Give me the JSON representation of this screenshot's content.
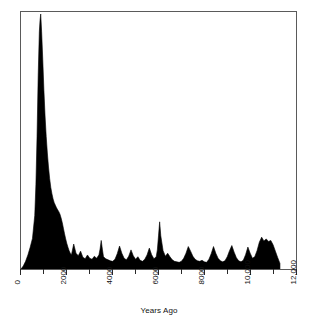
{
  "chart_data": {
    "type": "area",
    "title": "",
    "xlabel": "Years Ago",
    "ylabel": "Probability of Occurrence",
    "xlim": [
      0,
      12000
    ],
    "ylim": [
      0,
      1
    ],
    "grid": false,
    "legend": null,
    "fill_color": "#000000",
    "line_color": "#000000",
    "frame_color": "#5a5a5a",
    "axis_ticks_every": 1000,
    "axis_labels_every": 2000,
    "xtick_values": [
      0,
      1000,
      2000,
      3000,
      4000,
      5000,
      6000,
      7000,
      8000,
      9000,
      10000,
      11000,
      12000
    ],
    "xtick_labels": [
      "0",
      "",
      "2000",
      "",
      "4000",
      "",
      "6000",
      "",
      "8000",
      "",
      "10,000",
      "",
      "12,000"
    ],
    "xtick_labels_rotation_deg": -90,
    "ytick_labels": [],
    "x": [
      0,
      100,
      200,
      300,
      400,
      500,
      600,
      650,
      700,
      750,
      800,
      830,
      860,
      900,
      950,
      1000,
      1050,
      1100,
      1150,
      1200,
      1250,
      1300,
      1350,
      1400,
      1450,
      1500,
      1550,
      1600,
      1650,
      1700,
      1750,
      1800,
      1850,
      1900,
      1950,
      2000,
      2050,
      2100,
      2150,
      2200,
      2300,
      2400,
      2500,
      2600,
      2700,
      2800,
      2900,
      3000,
      3100,
      3200,
      3300,
      3400,
      3450,
      3500,
      3550,
      3600,
      3700,
      3800,
      3900,
      4000,
      4100,
      4200,
      4300,
      4400,
      4500,
      4600,
      4700,
      4800,
      4900,
      5000,
      5100,
      5200,
      5300,
      5400,
      5500,
      5600,
      5700,
      5800,
      5900,
      5950,
      6000,
      6050,
      6100,
      6200,
      6300,
      6400,
      6500,
      6600,
      6700,
      6800,
      6900,
      7000,
      7100,
      7200,
      7300,
      7400,
      7500,
      7600,
      7700,
      7800,
      7900,
      8000,
      8100,
      8200,
      8300,
      8400,
      8500,
      8600,
      8700,
      8800,
      8900,
      9000,
      9100,
      9200,
      9300,
      9400,
      9500,
      9600,
      9700,
      9800,
      9900,
      10000,
      10100,
      10200,
      10300,
      10400,
      10500,
      10600,
      10700,
      10800,
      10900,
      11000,
      11100,
      11200,
      11300
    ],
    "y": [
      0.0,
      0.012,
      0.03,
      0.055,
      0.085,
      0.12,
      0.21,
      0.33,
      0.52,
      0.76,
      0.93,
      0.975,
      1.0,
      0.93,
      0.82,
      0.7,
      0.6,
      0.52,
      0.455,
      0.4,
      0.355,
      0.32,
      0.295,
      0.275,
      0.26,
      0.25,
      0.24,
      0.232,
      0.225,
      0.215,
      0.2,
      0.182,
      0.16,
      0.138,
      0.118,
      0.1,
      0.085,
      0.072,
      0.062,
      0.055,
      0.098,
      0.062,
      0.052,
      0.07,
      0.046,
      0.04,
      0.055,
      0.042,
      0.038,
      0.05,
      0.042,
      0.055,
      0.078,
      0.112,
      0.078,
      0.048,
      0.04,
      0.036,
      0.032,
      0.03,
      0.038,
      0.06,
      0.09,
      0.062,
      0.042,
      0.036,
      0.05,
      0.075,
      0.052,
      0.038,
      0.048,
      0.034,
      0.03,
      0.038,
      0.055,
      0.082,
      0.056,
      0.04,
      0.048,
      0.075,
      0.13,
      0.185,
      0.13,
      0.072,
      0.05,
      0.062,
      0.048,
      0.036,
      0.03,
      0.028,
      0.026,
      0.03,
      0.042,
      0.062,
      0.088,
      0.07,
      0.05,
      0.038,
      0.032,
      0.03,
      0.034,
      0.028,
      0.026,
      0.038,
      0.06,
      0.088,
      0.062,
      0.042,
      0.032,
      0.028,
      0.032,
      0.048,
      0.072,
      0.092,
      0.066,
      0.044,
      0.032,
      0.028,
      0.034,
      0.056,
      0.086,
      0.062,
      0.042,
      0.048,
      0.072,
      0.105,
      0.125,
      0.11,
      0.118,
      0.108,
      0.112,
      0.095,
      0.07,
      0.045,
      0.022,
      0.008,
      0.002,
      0.0
    ]
  }
}
